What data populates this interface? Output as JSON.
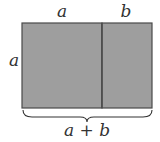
{
  "diagram": {
    "labels": {
      "top_left": "a",
      "top_right": "b",
      "left_side": "a",
      "bottom_sum": "a + b"
    },
    "colors": {
      "fill": "#9e9e9e",
      "stroke": "#4a4a4a",
      "text": "#333333"
    }
  }
}
